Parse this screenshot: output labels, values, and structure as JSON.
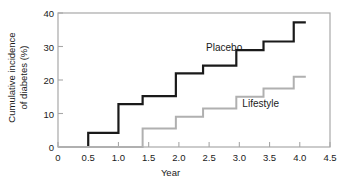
{
  "chart_data": {
    "type": "line",
    "subtype": "step",
    "title": "",
    "xlabel": "Year",
    "ylabel": "Cumulative incidence of diabetes (%)",
    "ylabel_line1": "Cumulative incidence",
    "ylabel_line2": "of diabetes (%)",
    "xlim": [
      0,
      4.5
    ],
    "ylim": [
      0,
      40
    ],
    "xticks": [
      0,
      0.5,
      1.0,
      1.5,
      2.0,
      2.5,
      3.0,
      3.5,
      4.0,
      4.5
    ],
    "xticklabels": [
      "0",
      "0.5",
      "1.0",
      "1.5",
      "2.0",
      "2.5",
      "3.0",
      "3.5",
      "4.0",
      "4.5"
    ],
    "yticks": [
      0,
      10,
      20,
      30,
      40
    ],
    "yticklabels": [
      "0",
      "10",
      "20",
      "30",
      "40"
    ],
    "grid": false,
    "legend": "inline-annotations",
    "series": [
      {
        "name": "Placebo",
        "color": "#1a1a1a",
        "linewidth": 2.2,
        "label_x": 2.45,
        "label_y": 29.5,
        "x": [
          0,
          0.5,
          1.0,
          1.4,
          1.95,
          2.4,
          2.95,
          3.4,
          3.9,
          4.1
        ],
        "y": [
          0,
          4.2,
          12.8,
          15.2,
          22.0,
          24.3,
          28.9,
          31.5,
          37.2,
          37.2
        ]
      },
      {
        "name": "Lifestyle",
        "color": "#b0b0b0",
        "linewidth": 2.0,
        "label_x": 3.05,
        "label_y": 12.8,
        "x": [
          0,
          1.4,
          1.95,
          2.4,
          2.95,
          3.4,
          3.9,
          4.1
        ],
        "y": [
          0,
          5.5,
          9.0,
          11.5,
          15.0,
          17.5,
          21.0,
          21.0
        ]
      }
    ],
    "axis_color": "#a8a8a8",
    "tick_color": "#a8a8a8",
    "text_color": "#1a1a1a",
    "background": "#ffffff"
  }
}
